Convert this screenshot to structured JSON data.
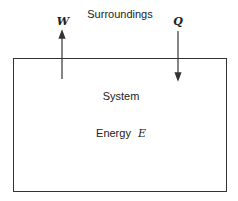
{
  "labels": {
    "surroundings": "Surroundings",
    "work": "W",
    "heat": "Q",
    "system": "System",
    "energy_prefix": "Energy",
    "energy_symbol": "E"
  },
  "arrows": [
    {
      "name": "work-arrow",
      "label": "W",
      "direction": "up"
    },
    {
      "name": "heat-arrow",
      "label": "Q",
      "direction": "down"
    }
  ],
  "colors": {
    "line": "#333333",
    "text": "#222222"
  }
}
